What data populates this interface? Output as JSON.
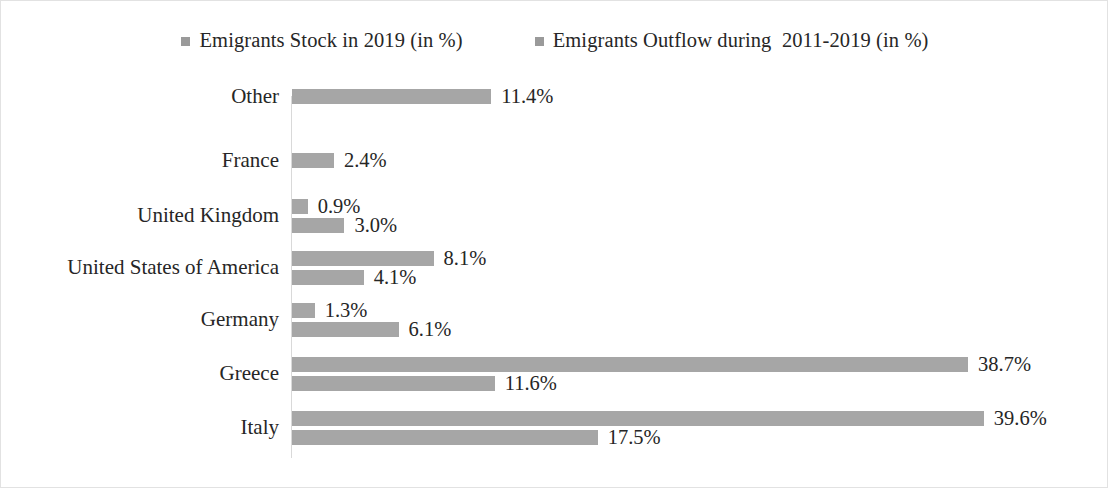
{
  "figure": {
    "background_color": "#ffffff",
    "border_color": "#e2e2e2",
    "bar_color": "#a6a6a6",
    "axis_color": "#d9d9d9",
    "text_color": "#262626"
  },
  "legend": {
    "position": "top-center",
    "entries": [
      {
        "label": "Emigrants Stock in 2019 (in %)",
        "swatch_name": "legend-swatch-stock",
        "color": "#9a9a9a"
      },
      {
        "label": "Emigrants Outflow during  2011-2019 (in %)",
        "swatch_name": "legend-swatch-outflow",
        "color": "#9a9a9a"
      }
    ]
  },
  "chart_data": {
    "type": "bar",
    "orientation": "horizontal",
    "title": "",
    "xlabel": "",
    "ylabel": "",
    "grid": false,
    "legend_position": "top",
    "xlim": [
      0,
      45
    ],
    "px_per_unit": 17.47,
    "categories": [
      "Other",
      "France",
      "United Kingdom",
      "United States of America",
      "Germany",
      "Greece",
      "Italy"
    ],
    "series": [
      {
        "name": "Emigrants Stock in 2019 (in %)",
        "values": [
          11.4,
          2.4,
          0.9,
          8.1,
          1.3,
          38.7,
          39.6
        ],
        "labels": [
          "11.4%",
          "2.4%",
          "0.9%",
          "8.1%",
          "1.3%",
          "38.7%",
          "39.6%"
        ]
      },
      {
        "name": "Emigrants Outflow during  2011-2019 (in %)",
        "values": [
          null,
          null,
          3.0,
          4.1,
          6.1,
          11.6,
          17.5
        ],
        "labels": [
          null,
          null,
          "3.0%",
          "4.1%",
          "6.1%",
          "11.6%",
          "17.5%"
        ]
      }
    ],
    "rows": [
      {
        "category": "Other",
        "top": 0,
        "bars": [
          {
            "series": "Emigrants Stock in 2019 (in %)",
            "value": 11.4,
            "label": "11.4%"
          }
        ]
      },
      {
        "category": "France",
        "top": 64,
        "bars": [
          {
            "series": "Emigrants Stock in 2019 (in %)",
            "value": 2.4,
            "label": "2.4%"
          }
        ]
      },
      {
        "category": "United Kingdom",
        "top": 110,
        "bars": [
          {
            "series": "Emigrants Stock in 2019 (in %)",
            "value": 0.9,
            "label": "0.9%"
          },
          {
            "series": "Emigrants Outflow during  2011-2019 (in %)",
            "value": 3.0,
            "label": "3.0%"
          }
        ]
      },
      {
        "category": "United States of America",
        "top": 162,
        "bars": [
          {
            "series": "Emigrants Stock in 2019 (in %)",
            "value": 8.1,
            "label": "8.1%"
          },
          {
            "series": "Emigrants Outflow during  2011-2019 (in %)",
            "value": 4.1,
            "label": "4.1%"
          }
        ]
      },
      {
        "category": "Germany",
        "top": 214,
        "bars": [
          {
            "series": "Emigrants Stock in 2019 (in %)",
            "value": 1.3,
            "label": "1.3%"
          },
          {
            "series": "Emigrants Outflow during  2011-2019 (in %)",
            "value": 6.1,
            "label": "6.1%"
          }
        ]
      },
      {
        "category": "Greece",
        "top": 268,
        "bars": [
          {
            "series": "Emigrants Stock in 2019 (in %)",
            "value": 38.7,
            "label": "38.7%"
          },
          {
            "series": "Emigrants Outflow during  2011-2019 (in %)",
            "value": 11.6,
            "label": "11.6%"
          }
        ]
      },
      {
        "category": "Italy",
        "top": 322,
        "bars": [
          {
            "series": "Emigrants Stock in 2019 (in %)",
            "value": 39.6,
            "label": "39.6%"
          },
          {
            "series": "Emigrants Outflow during  2011-2019 (in %)",
            "value": 17.5,
            "label": "17.5%"
          }
        ]
      }
    ]
  }
}
